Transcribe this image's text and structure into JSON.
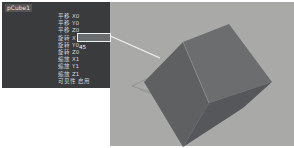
{
  "channel_box": {
    "object_name": "pCube1",
    "attributes": [
      {
        "label": "平移",
        "axis": "X",
        "value": "0"
      },
      {
        "label": "平移",
        "axis": "Y",
        "value": "0"
      },
      {
        "label": "平移",
        "axis": "Z",
        "value": "0"
      },
      {
        "label": "旋转",
        "axis": "X",
        "value": "45"
      },
      {
        "label": "旋转",
        "axis": "Y",
        "value": "0"
      },
      {
        "label": "旋转",
        "axis": "Z",
        "value": "0"
      },
      {
        "label": "缩放",
        "axis": "X",
        "value": "1"
      },
      {
        "label": "缩放",
        "axis": "Y",
        "value": "1"
      },
      {
        "label": "缩放",
        "axis": "Z",
        "value": "1"
      },
      {
        "label": "可见性",
        "axis": "",
        "value": "启用"
      }
    ],
    "selected_index": 3
  },
  "viewport": {
    "object": "cube rotated 45° on X",
    "background": "#a9aaa8"
  }
}
